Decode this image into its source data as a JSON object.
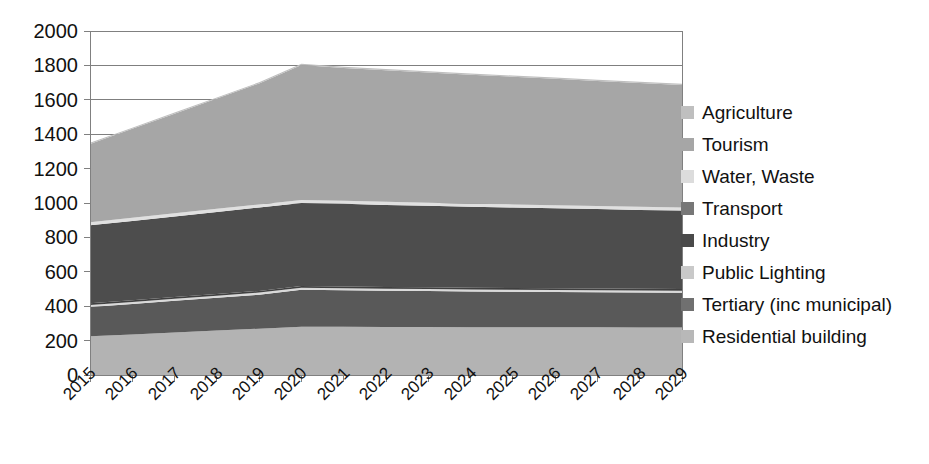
{
  "chart_data": {
    "type": "area",
    "stacked": true,
    "title": "",
    "xlabel": "",
    "ylabel": "",
    "categories": [
      "2015",
      "2016",
      "2017",
      "2018",
      "2019",
      "2020",
      "2021",
      "2022",
      "2023",
      "2024",
      "2025",
      "2026",
      "2027",
      "2028",
      "2029"
    ],
    "x": [
      2015,
      2016,
      2017,
      2018,
      2019,
      2020,
      2021,
      2022,
      2023,
      2024,
      2025,
      2026,
      2027,
      2028,
      2029
    ],
    "ylim": [
      0,
      2000
    ],
    "yticks": [
      0,
      200,
      400,
      600,
      800,
      1000,
      1200,
      1400,
      1600,
      1800,
      2000
    ],
    "ytick_labels": [
      "0",
      "200",
      "400",
      "600",
      "800",
      "1000",
      "1200",
      "1400",
      "1600",
      "1800",
      "2000"
    ],
    "grid": true,
    "legend_position": "right",
    "stack_order_bottom_to_top": [
      "Residential building",
      "Tertiary (inc municipal)",
      "Public Lighting",
      "Industry",
      "Transport",
      "Water, Waste",
      "Tourism",
      "Agriculture"
    ],
    "series": [
      {
        "name": "Residential building",
        "color": "#b3b3b3",
        "values": [
          225,
          236,
          247,
          258,
          269,
          280,
          280,
          279,
          279,
          278,
          278,
          277,
          277,
          276,
          276
        ]
      },
      {
        "name": "Tertiary (inc municipal)",
        "color": "#595959",
        "values": [
          170,
          177,
          184,
          191,
          198,
          215,
          213,
          211,
          209,
          207,
          206,
          205,
          204,
          203,
          202
        ]
      },
      {
        "name": "Public Lighting",
        "color": "#d9d9d9",
        "values": [
          12,
          12,
          12,
          12,
          12,
          12,
          12,
          12,
          12,
          12,
          12,
          12,
          12,
          12,
          12
        ]
      },
      {
        "name": "Industry",
        "color": "#404040",
        "values": [
          10,
          10,
          10,
          10,
          10,
          10,
          10,
          10,
          10,
          10,
          10,
          10,
          10,
          10,
          10
        ]
      },
      {
        "name": "Transport",
        "color": "#4d4d4d",
        "values": [
          453,
          461,
          469,
          477,
          485,
          483,
          480,
          477,
          474,
          471,
          468,
          465,
          462,
          459,
          456
        ]
      },
      {
        "name": "Water, Waste",
        "color": "#e0e0e0",
        "values": [
          18,
          18,
          18,
          18,
          18,
          18,
          18,
          18,
          18,
          18,
          18,
          18,
          18,
          18,
          18
        ]
      },
      {
        "name": "Tourism",
        "color": "#a6a6a6",
        "values": [
          455,
          517,
          579,
          641,
          703,
          785,
          772,
          765,
          757,
          750,
          742,
          735,
          727,
          720,
          712
        ]
      },
      {
        "name": "Agriculture",
        "color": "#bfbfbf",
        "values": [
          7,
          7,
          7,
          7,
          7,
          7,
          7,
          7,
          7,
          7,
          7,
          7,
          7,
          7,
          7
        ]
      }
    ],
    "totals": [
      1350,
      1438,
      1526,
      1614,
      1702,
      1810,
      1792,
      1779,
      1766,
      1753,
      1741,
      1728,
      1715,
      1703,
      1693
    ]
  },
  "legend": {
    "items": [
      {
        "label": "Agriculture",
        "color": "#bfbfbf"
      },
      {
        "label": "Tourism",
        "color": "#a6a6a6"
      },
      {
        "label": "Water, Waste",
        "color": "#dcdcdc"
      },
      {
        "label": "Transport",
        "color": "#777777"
      },
      {
        "label": "Industry",
        "color": "#4a4a4a"
      },
      {
        "label": "Public Lighting",
        "color": "#c9c9c9"
      },
      {
        "label": "Tertiary (inc municipal)",
        "color": "#707070"
      },
      {
        "label": "Residential building",
        "color": "#b8b8b8"
      }
    ]
  },
  "axes": {
    "y_tick_labels": [
      "2000",
      "1800",
      "1600",
      "1400",
      "1200",
      "1000",
      "800",
      "600",
      "400",
      "200",
      "0"
    ],
    "x_tick_labels": [
      "2015",
      "2016",
      "2017",
      "2018",
      "2019",
      "2020",
      "2021",
      "2022",
      "2023",
      "2024",
      "2025",
      "2026",
      "2027",
      "2028",
      "2029"
    ]
  },
  "style": {
    "plot_background": "#ffffff",
    "grid_color": "#7f7f7f",
    "axis_color": "#808080",
    "text_color": "#111111"
  }
}
